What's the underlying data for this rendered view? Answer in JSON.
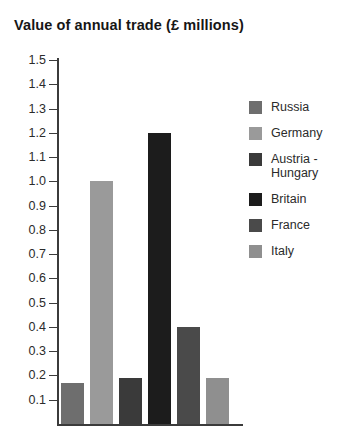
{
  "chart_data": {
    "type": "bar",
    "title": "Value of annual trade (£ millions)",
    "xlabel": "",
    "ylabel": "",
    "ylim": [
      0,
      1.5
    ],
    "grid": false,
    "legend_position": "right",
    "categories": [
      "Russia",
      "Germany",
      "Austria - Hungary",
      "Britain",
      "France",
      "Italy"
    ],
    "values": [
      0.17,
      1.0,
      0.19,
      1.2,
      0.4,
      0.19
    ],
    "ytick_labels": [
      "1.5",
      "1.4",
      "1.3",
      "1.2",
      "1.1",
      "1.0",
      "0.9",
      "0.8",
      "0.7",
      "0.6",
      "0.5",
      "0.4",
      "0.3",
      "0.2",
      "0.1"
    ],
    "ytick_values": [
      1.5,
      1.4,
      1.3,
      1.2,
      1.1,
      1.0,
      0.9,
      0.8,
      0.7,
      0.6,
      0.5,
      0.4,
      0.3,
      0.2,
      0.1
    ],
    "series": [
      {
        "name": "Value of annual trade",
        "values": [
          0.17,
          1.0,
          0.19,
          1.2,
          0.4,
          0.19
        ]
      }
    ],
    "bar_colors": [
      "#6e6e6e",
      "#9a9a9a",
      "#3a3a3a",
      "#1c1c1c",
      "#4a4a4a",
      "#8f8f8f"
    ]
  },
  "legend": {
    "items": [
      {
        "label": "Russia",
        "color": "#6e6e6e"
      },
      {
        "label": "Germany",
        "color": "#9a9a9a"
      },
      {
        "label": "Austria -\nHungary",
        "color": "#3a3a3a"
      },
      {
        "label": "Britain",
        "color": "#1c1c1c"
      },
      {
        "label": "France",
        "color": "#4a4a4a"
      },
      {
        "label": "Italy",
        "color": "#8f8f8f"
      }
    ]
  },
  "colors": {
    "background": "#ffffff",
    "axis": "#3b3b3b",
    "text": "#1a1a1a"
  }
}
